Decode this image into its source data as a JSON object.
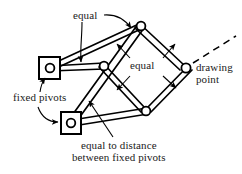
{
  "figure": {
    "type": "mechanical-linkage-diagram",
    "background_color": "#ffffff",
    "ink_color": "#000000"
  },
  "labels": {
    "equal_top": "equal",
    "equal_middle": "equal",
    "drawing_point_line1": "drawing",
    "drawing_point_line2": "point",
    "fixed_pivots": "fixed pivots",
    "equal_distance_line1": "equal to distance",
    "equal_distance_line2": "between fixed pivots"
  },
  "joints": [
    {
      "name": "fixed-pivot-upper",
      "x": 50,
      "y": 68,
      "fixed": true
    },
    {
      "name": "fixed-pivot-lower",
      "x": 71,
      "y": 123,
      "fixed": true
    },
    {
      "name": "joint-top",
      "x": 141,
      "y": 26,
      "fixed": false
    },
    {
      "name": "joint-middle",
      "x": 104,
      "y": 66,
      "fixed": false
    },
    {
      "name": "joint-bottom",
      "x": 146,
      "y": 111,
      "fixed": false
    },
    {
      "name": "drawing-point",
      "x": 186,
      "y": 68,
      "fixed": false
    }
  ],
  "links": [
    {
      "name": "link-upperpivot-to-top",
      "from": "fixed-pivot-upper",
      "to": "joint-top"
    },
    {
      "name": "link-upperpivot-to-middle",
      "from": "fixed-pivot-upper",
      "to": "joint-middle"
    },
    {
      "name": "link-lowerpivot-to-top",
      "from": "fixed-pivot-lower",
      "to": "joint-top"
    },
    {
      "name": "link-lowerpivot-to-bottom",
      "from": "fixed-pivot-lower",
      "to": "joint-bottom"
    },
    {
      "name": "link-middle-to-bottom",
      "from": "joint-middle",
      "to": "joint-bottom"
    },
    {
      "name": "link-top-to-drawingpoint",
      "from": "joint-top",
      "to": "drawing-point"
    },
    {
      "name": "link-bottom-to-drawingpoint",
      "from": "joint-bottom",
      "to": "drawing-point"
    }
  ],
  "dashed_ray": {
    "name": "drawing-path-ray",
    "from_x": 192,
    "from_y": 64,
    "to_x": 236,
    "to_y": 36
  },
  "colors": {
    "line": "#000000",
    "joint_fill": "#ffffff",
    "text": "#1a1a1a"
  }
}
